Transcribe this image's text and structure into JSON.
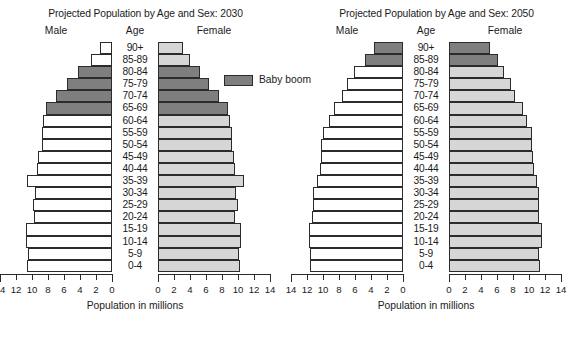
{
  "figure": {
    "axis_caption": "Population in millions",
    "legend_label": "Baby boom",
    "heads": {
      "male": "Male",
      "age": "Age",
      "female": "Female"
    },
    "colors": {
      "baby_boom": "#7f7f7f",
      "female_bar": "#d6d6d6",
      "male_bar": "#ffffff",
      "outline": "#2b2b2b",
      "background": "#ffffff"
    }
  },
  "chart_data": [
    {
      "type": "bar",
      "title": "Projected Population by Age and Sex: 2030",
      "xlabel": "Population in millions",
      "ylabel": "Age",
      "xlim": [
        0,
        14
      ],
      "xticks": [
        14,
        12,
        10,
        8,
        6,
        4,
        2,
        0
      ],
      "xticks_right": [
        0,
        2,
        4,
        6,
        8,
        10,
        12,
        14
      ],
      "grid": false,
      "legend": [
        "Baby boom"
      ],
      "categories": [
        "90+",
        "85-89",
        "80-84",
        "75-79",
        "70-74",
        "65-69",
        "60-64",
        "55-59",
        "50-54",
        "45-49",
        "40-44",
        "35-39",
        "30-34",
        "25-29",
        "20-24",
        "15-19",
        "10-14",
        "5-9",
        "0-4"
      ],
      "series": [
        {
          "name": "Male",
          "values": [
            1.5,
            2.6,
            4.2,
            5.6,
            7.0,
            8.2,
            8.6,
            8.8,
            8.8,
            9.2,
            9.4,
            10.6,
            9.6,
            9.9,
            9.8,
            10.8,
            10.8,
            10.5,
            10.6
          ],
          "boom_flags": [
            false,
            false,
            true,
            true,
            true,
            true,
            false,
            false,
            false,
            false,
            false,
            false,
            false,
            false,
            false,
            false,
            false,
            false,
            false
          ]
        },
        {
          "name": "Female",
          "values": [
            3.1,
            4.0,
            5.3,
            6.4,
            7.6,
            8.7,
            9.0,
            9.2,
            9.2,
            9.5,
            9.6,
            10.7,
            9.8,
            10.0,
            9.6,
            10.4,
            10.4,
            10.1,
            10.2
          ],
          "boom_flags": [
            false,
            false,
            true,
            true,
            true,
            true,
            false,
            false,
            false,
            false,
            false,
            false,
            false,
            false,
            false,
            false,
            false,
            false,
            false
          ]
        }
      ]
    },
    {
      "type": "bar",
      "title": "Projected Population by Age and Sex: 2050",
      "xlabel": "Population in millions",
      "ylabel": "Age",
      "xlim": [
        0,
        14
      ],
      "xticks": [
        14,
        12,
        10,
        8,
        6,
        4,
        2,
        0
      ],
      "xticks_right": [
        0,
        2,
        4,
        6,
        8,
        10,
        12,
        14
      ],
      "grid": false,
      "legend": [
        "Baby boom"
      ],
      "categories": [
        "90+",
        "85-89",
        "80-84",
        "75-79",
        "70-74",
        "65-69",
        "60-64",
        "55-59",
        "50-54",
        "45-49",
        "40-44",
        "35-39",
        "30-34",
        "25-29",
        "20-24",
        "15-19",
        "10-14",
        "5-9",
        "0-4"
      ],
      "series": [
        {
          "name": "Male",
          "values": [
            3.6,
            4.8,
            6.1,
            7.0,
            7.6,
            8.6,
            9.2,
            10.0,
            10.2,
            10.2,
            10.4,
            10.8,
            11.2,
            11.2,
            11.4,
            11.8,
            11.8,
            11.6,
            11.6
          ],
          "boom_flags": [
            true,
            true,
            false,
            false,
            false,
            false,
            false,
            false,
            false,
            false,
            false,
            false,
            false,
            false,
            false,
            false,
            false,
            false,
            false
          ]
        },
        {
          "name": "Female",
          "values": [
            5.1,
            6.1,
            6.9,
            7.7,
            8.3,
            9.2,
            9.7,
            10.4,
            10.4,
            10.5,
            10.6,
            11.0,
            11.3,
            11.3,
            11.3,
            11.6,
            11.6,
            11.3,
            11.4
          ],
          "boom_flags": [
            true,
            true,
            false,
            false,
            false,
            false,
            false,
            false,
            false,
            false,
            false,
            false,
            false,
            false,
            false,
            false,
            false,
            false,
            false
          ]
        }
      ]
    }
  ]
}
